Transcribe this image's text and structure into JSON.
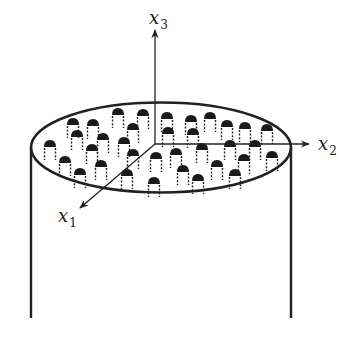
{
  "figure": {
    "colors": {
      "stroke": "#222222",
      "bump_fill": "#1a1a1a",
      "background": "#ffffff"
    },
    "cylinder": {
      "left_x": 31,
      "right_x": 291,
      "top_y": 147,
      "bottom_y": 318
    },
    "ellipse": {
      "cx": 161,
      "cy": 147.5,
      "rx": 130,
      "ry": 45
    },
    "origin": {
      "x": 155,
      "y": 144
    },
    "axes": [
      {
        "id": "x1",
        "name": "x",
        "sub": "1",
        "end": [
          80,
          208
        ],
        "label_pos": [
          58,
          222
        ]
      },
      {
        "id": "x2",
        "name": "x",
        "sub": "2",
        "end": [
          309,
          144
        ],
        "label_pos": [
          318,
          150
        ]
      },
      {
        "id": "x3",
        "name": "x",
        "sub": "3",
        "end": [
          155,
          30
        ],
        "label_pos": [
          149,
          24
        ]
      }
    ],
    "bumps": [
      [
        118,
        113
      ],
      [
        143,
        114
      ],
      [
        167,
        117
      ],
      [
        191,
        120
      ],
      [
        210,
        117
      ],
      [
        73,
        123
      ],
      [
        93,
        124
      ],
      [
        133,
        128
      ],
      [
        168,
        132
      ],
      [
        193,
        133
      ],
      [
        227,
        125
      ],
      [
        245,
        127
      ],
      [
        267,
        129
      ],
      [
        77,
        135
      ],
      [
        103,
        138
      ],
      [
        124,
        142
      ],
      [
        50,
        145
      ],
      [
        92,
        149
      ],
      [
        230,
        145
      ],
      [
        255,
        145
      ],
      [
        202,
        148
      ],
      [
        133,
        154
      ],
      [
        156,
        157
      ],
      [
        176,
        153
      ],
      [
        65,
        161
      ],
      [
        101,
        165
      ],
      [
        244,
        159
      ],
      [
        272,
        156
      ],
      [
        217,
        165
      ],
      [
        80,
        173
      ],
      [
        127,
        174
      ],
      [
        183,
        170
      ],
      [
        235,
        174
      ],
      [
        154,
        182
      ],
      [
        198,
        179
      ]
    ]
  }
}
